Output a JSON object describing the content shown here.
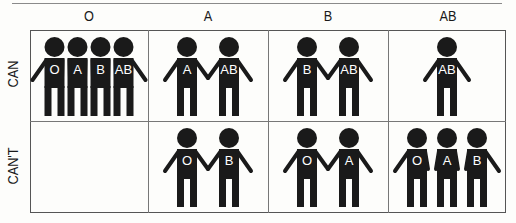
{
  "columns": [
    "O",
    "A",
    "B",
    "AB"
  ],
  "rows": [
    "CAN",
    "CAN'T"
  ],
  "cells": {
    "can": {
      "O": [
        "O",
        "A",
        "B",
        "AB"
      ],
      "A": [
        "A",
        "AB"
      ],
      "B": [
        "B",
        "AB"
      ],
      "AB": [
        "AB"
      ]
    },
    "cant": {
      "O": [],
      "A": [
        "O",
        "B"
      ],
      "B": [
        "O",
        "A"
      ],
      "AB": [
        "O",
        "A",
        "B"
      ]
    }
  },
  "colors": {
    "figure": "#1a1a1a",
    "label": "#ffffff",
    "grid": "#666666"
  }
}
